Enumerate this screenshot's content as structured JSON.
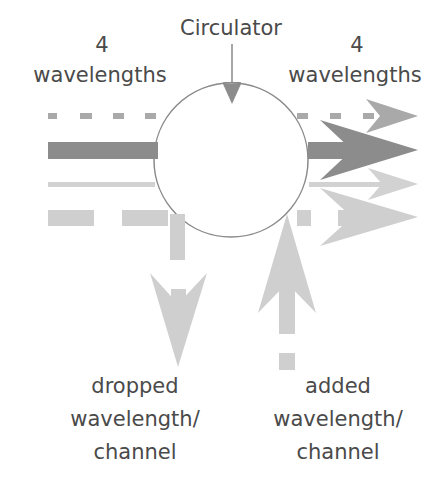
{
  "diagram": {
    "title": "Circulator",
    "input_label": {
      "count": "4",
      "unit": "wavelengths"
    },
    "output_label": {
      "count": "4",
      "unit": "wavelengths"
    },
    "drop_label": [
      "dropped",
      "wavelength/",
      "channel"
    ],
    "add_label": [
      "added",
      "wavelength/",
      "channel"
    ],
    "colors": {
      "circle_stroke": "#8a8a8a",
      "dark": "#8c8c8c",
      "medium": "#a9a9a9",
      "light": "#cfcfcf",
      "text": "#4a4a4a"
    },
    "channels": [
      {
        "name": "wavelength-1",
        "style": "dotted",
        "color": "#a9a9a9"
      },
      {
        "name": "wavelength-2",
        "style": "solid-thick",
        "color": "#8c8c8c"
      },
      {
        "name": "wavelength-3",
        "style": "solid-thin",
        "color": "#cfcfcf"
      },
      {
        "name": "wavelength-4",
        "style": "dashed-wide",
        "color": "#cfcfcf",
        "note": "dropped and re-added"
      }
    ]
  }
}
